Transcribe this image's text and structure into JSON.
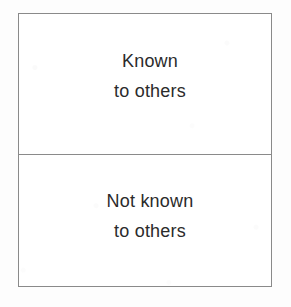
{
  "diagram": {
    "kind": "johari-window-axis-labels",
    "background_color": "#fdfdfd",
    "panel_background_color": "#ffffff",
    "border_color": "#8a8a8a",
    "text_color": "#2b2b2b",
    "cells": [
      {
        "name": "known-to-others",
        "line1": "Known",
        "line2": "to others"
      },
      {
        "name": "not-known-to-others",
        "line1": "Not known",
        "line2": "to others"
      }
    ]
  }
}
